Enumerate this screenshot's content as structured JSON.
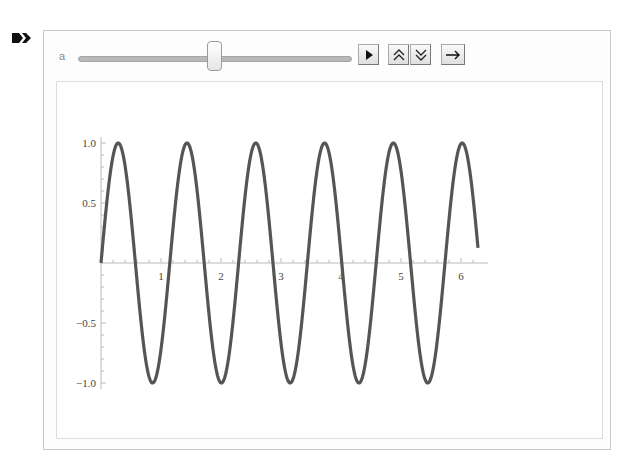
{
  "cell": {
    "bracket_icon": "cell-output-arrow-icon"
  },
  "controls": {
    "variable_label": "a",
    "slider": {
      "min": 1,
      "max": 10,
      "value": 5.5
    },
    "buttons": [
      {
        "name": "play-button",
        "glyph": "▶",
        "icon": "play-icon"
      },
      {
        "name": "faster-button",
        "glyph": "≈",
        "icon": "double-chevron-up-icon"
      },
      {
        "name": "slower-button",
        "glyph": "≈",
        "icon": "double-chevron-down-icon"
      },
      {
        "name": "direction-button",
        "glyph": "→",
        "icon": "arrow-right-icon"
      }
    ]
  },
  "chart_data": {
    "type": "line",
    "title": "",
    "function": "Sin[a x]",
    "parameter_a": 5.48,
    "xlabel": "",
    "ylabel": "",
    "xlim": [
      0,
      6.283
    ],
    "ylim": [
      -1.0,
      1.0
    ],
    "x_ticks": [
      "1",
      "2",
      "3",
      "4",
      "5",
      "6"
    ],
    "y_ticks": [
      "1.0",
      "0.5",
      "-0.5",
      "-1.0"
    ],
    "grid": false,
    "series": [
      {
        "name": "sin(a x)",
        "color": "#555555",
        "peaks_x": [
          0.29,
          1.43,
          2.58,
          3.73,
          4.87,
          6.02
        ],
        "troughs_x": [
          0.86,
          2.01,
          3.15,
          4.3,
          5.44
        ],
        "end_point": [
          6.283,
          0.12
        ]
      }
    ]
  }
}
